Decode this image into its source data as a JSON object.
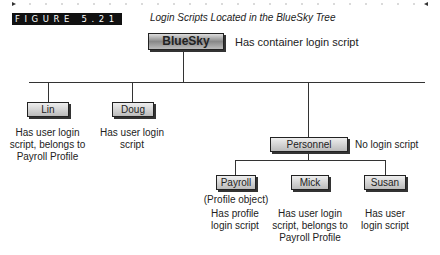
{
  "figure": {
    "label": "FIGURE 5.21",
    "title": "Login Scripts Located in the BlueSky Tree"
  },
  "tree": {
    "root": {
      "name": "BlueSky",
      "note": "Has container login script"
    },
    "level1": [
      {
        "name": "Lin",
        "note": "Has user login script, belongs to Payroll Profile"
      },
      {
        "name": "Doug",
        "note": "Has user login script"
      },
      {
        "name": "Personnel",
        "note": "No login script"
      }
    ],
    "level2": [
      {
        "name": "Payroll",
        "subnote": "(Profile object)",
        "note": "Has profile login script"
      },
      {
        "name": "Mick",
        "note": "Has user login script, belongs to Payroll Profile"
      },
      {
        "name": "Susan",
        "note": "Has user login script"
      }
    ]
  }
}
